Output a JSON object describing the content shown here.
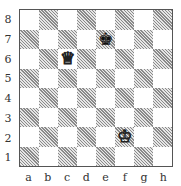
{
  "diagram": {
    "ranks": [
      "8",
      "7",
      "6",
      "5",
      "4",
      "3",
      "2",
      "1"
    ],
    "files": [
      "a",
      "b",
      "c",
      "d",
      "e",
      "f",
      "g",
      "h"
    ],
    "pieces": [
      {
        "square": "e7",
        "color": "black",
        "type": "king",
        "glyph": "♚"
      },
      {
        "square": "c6",
        "color": "white",
        "type": "queen",
        "glyph": "♕"
      },
      {
        "square": "f2",
        "color": "white",
        "type": "king",
        "glyph": "♔"
      }
    ],
    "colors": {
      "light_square": "#ffffff",
      "dark_square_hatch": "#8a8a8a",
      "border": "#555555"
    }
  }
}
